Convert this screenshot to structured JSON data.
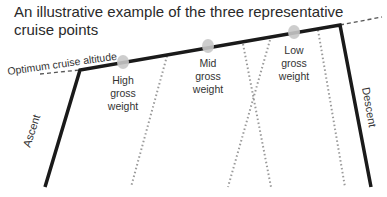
{
  "title": {
    "line1": "An illustrative example of the three representative",
    "line2": "cruise points"
  },
  "labels": {
    "optimum": "Optimum cruise altitude",
    "ascent": "Ascent",
    "descent": "Descent"
  },
  "points": [
    {
      "name": "high",
      "line1": "High",
      "line2": "gross",
      "line3": "weight"
    },
    {
      "name": "mid",
      "line1": "Mid",
      "line2": "gross",
      "line3": "weight"
    },
    {
      "name": "low",
      "line1": "Low",
      "line2": "gross",
      "line3": "weight"
    }
  ],
  "colors": {
    "flight_path": "#1a1a1a",
    "dotted": "#9a9a9a",
    "marker": "#c8c8c8"
  }
}
